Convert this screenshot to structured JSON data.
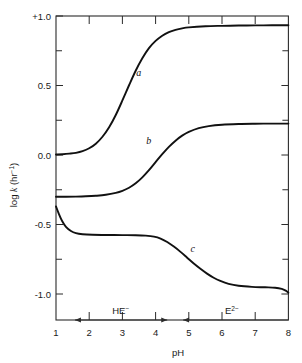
{
  "chart_data": {
    "type": "line",
    "title": "",
    "xlabel": "pH",
    "ylabel": "log k (hr⁻¹)",
    "ylabel_parts": {
      "prefix": "log ",
      "italic": "k",
      "suffix": " (hr",
      "sup": "−1",
      "tail": ")"
    },
    "xlim": [
      1,
      8
    ],
    "ylim": [
      -1.195,
      1.0
    ],
    "grid": false,
    "legend": "inline curve labels a, b, c",
    "xticks": [
      1,
      2,
      3,
      4,
      5,
      6,
      7,
      8
    ],
    "xticklabels": [
      "1",
      "2",
      "3",
      "4",
      "5",
      "6",
      "7",
      "8"
    ],
    "yticks": [
      1.0,
      0.75,
      0.5,
      0.25,
      0.0,
      -0.25,
      -0.5,
      -0.75,
      -1.0
    ],
    "yticklabels_major": [
      "+1.0",
      "0.5",
      "0.0",
      "-0.5",
      "-1.0"
    ],
    "ytick_major_values": [
      1.0,
      0.5,
      0.0,
      -0.5,
      -1.0
    ],
    "ytick_minor_values": [
      0.75,
      0.25,
      -0.25,
      -0.75
    ],
    "series": [
      {
        "name": "a",
        "label": "a",
        "label_at": {
          "x": 3.42,
          "y": 0.565
        },
        "points": [
          [
            1.0,
            0.0
          ],
          [
            1.2,
            0.002
          ],
          [
            1.4,
            0.006
          ],
          [
            1.6,
            0.012
          ],
          [
            1.8,
            0.024
          ],
          [
            2.0,
            0.045
          ],
          [
            2.2,
            0.078
          ],
          [
            2.4,
            0.128
          ],
          [
            2.6,
            0.196
          ],
          [
            2.8,
            0.285
          ],
          [
            3.0,
            0.39
          ],
          [
            3.2,
            0.5
          ],
          [
            3.4,
            0.605
          ],
          [
            3.6,
            0.695
          ],
          [
            3.8,
            0.768
          ],
          [
            4.0,
            0.82
          ],
          [
            4.2,
            0.858
          ],
          [
            4.4,
            0.884
          ],
          [
            4.6,
            0.9
          ],
          [
            4.8,
            0.911
          ],
          [
            5.0,
            0.918
          ],
          [
            5.5,
            0.926
          ],
          [
            6.0,
            0.929
          ],
          [
            6.5,
            0.931
          ],
          [
            7.0,
            0.932
          ],
          [
            7.5,
            0.933
          ],
          [
            8.0,
            0.933
          ]
        ]
      },
      {
        "name": "b",
        "label": "b",
        "label_at": {
          "x": 3.72,
          "y": 0.075
        },
        "points": [
          [
            1.0,
            -0.305
          ],
          [
            1.3,
            -0.305
          ],
          [
            1.6,
            -0.304
          ],
          [
            1.9,
            -0.302
          ],
          [
            2.2,
            -0.298
          ],
          [
            2.5,
            -0.291
          ],
          [
            2.8,
            -0.277
          ],
          [
            3.0,
            -0.262
          ],
          [
            3.2,
            -0.24
          ],
          [
            3.4,
            -0.208
          ],
          [
            3.6,
            -0.165
          ],
          [
            3.8,
            -0.113
          ],
          [
            4.0,
            -0.055
          ],
          [
            4.2,
            0.002
          ],
          [
            4.4,
            0.055
          ],
          [
            4.6,
            0.1
          ],
          [
            4.8,
            0.136
          ],
          [
            5.0,
            0.163
          ],
          [
            5.3,
            0.19
          ],
          [
            5.6,
            0.205
          ],
          [
            6.0,
            0.215
          ],
          [
            6.5,
            0.22
          ],
          [
            7.0,
            0.222
          ],
          [
            7.5,
            0.223
          ],
          [
            8.0,
            0.223
          ]
        ]
      },
      {
        "name": "c",
        "label": "c",
        "label_at": {
          "x": 5.05,
          "y": -0.705
        },
        "points": [
          [
            1.0,
            -0.375
          ],
          [
            1.08,
            -0.425
          ],
          [
            1.18,
            -0.478
          ],
          [
            1.3,
            -0.522
          ],
          [
            1.45,
            -0.552
          ],
          [
            1.6,
            -0.568
          ],
          [
            1.8,
            -0.576
          ],
          [
            2.1,
            -0.58
          ],
          [
            2.5,
            -0.581
          ],
          [
            3.0,
            -0.582
          ],
          [
            3.4,
            -0.583
          ],
          [
            3.7,
            -0.586
          ],
          [
            3.95,
            -0.593
          ],
          [
            4.15,
            -0.607
          ],
          [
            4.35,
            -0.632
          ],
          [
            4.55,
            -0.665
          ],
          [
            4.75,
            -0.703
          ],
          [
            4.95,
            -0.745
          ],
          [
            5.15,
            -0.787
          ],
          [
            5.35,
            -0.825
          ],
          [
            5.55,
            -0.86
          ],
          [
            5.75,
            -0.89
          ],
          [
            5.95,
            -0.913
          ],
          [
            6.2,
            -0.934
          ],
          [
            6.5,
            -0.948
          ],
          [
            6.9,
            -0.956
          ],
          [
            7.3,
            -0.959
          ],
          [
            7.6,
            -0.962
          ],
          [
            7.8,
            -0.97
          ],
          [
            7.92,
            -0.983
          ],
          [
            8.0,
            -0.998
          ]
        ]
      }
    ],
    "annotations": [
      {
        "name": "HE-",
        "label_prefix": "HE",
        "label_sup": "−",
        "label_at_x": 2.95,
        "arrow_from_x": 1.57,
        "arrow_to_x": 4.35,
        "arrow_y": -1.195,
        "arrow_style": "double-headed"
      },
      {
        "name": "E2-",
        "label_prefix": "E",
        "label_sup": "2−",
        "label_at_x": 6.3,
        "arrow_from_x": 4.83,
        "arrow_to_x": 8.0,
        "arrow_y": -1.195,
        "arrow_style": "left-headed"
      }
    ],
    "colors": {
      "curve": "#111111",
      "axis": "#2b2b2b",
      "background": "#ffffff",
      "text": "#1a1a1a"
    }
  }
}
